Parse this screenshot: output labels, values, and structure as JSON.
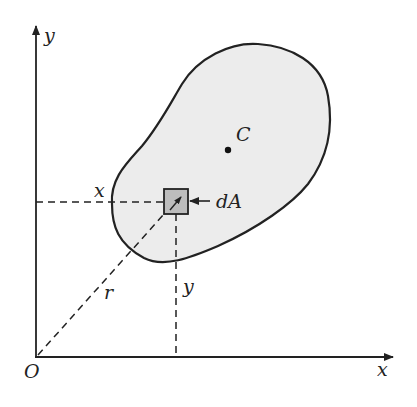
{
  "diagram": {
    "labels": {
      "y_axis": "y",
      "x_axis": "x",
      "origin": "O",
      "centroid": "C",
      "element": "dA",
      "x_distance": "x",
      "y_distance": "y",
      "radius": "r"
    },
    "colors": {
      "region_fill": "#ececec",
      "element_fill": "#bdbdbd",
      "stroke": "#222222"
    }
  }
}
